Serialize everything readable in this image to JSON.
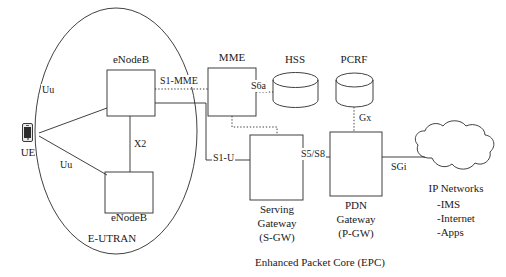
{
  "diagram": {
    "caption": "Enhanced Packet Core (EPC)",
    "domain_label": "E-UTRAN",
    "stroke_color": "#2b2b2b",
    "text_color": "#1a1a1a",
    "background": "#ffffff"
  },
  "nodes": {
    "ue": {
      "label": "UE",
      "icon": "mobile-phone-icon"
    },
    "enodeb_top": {
      "label": "eNodeB"
    },
    "enodeb_bottom": {
      "label": "eNodeB"
    },
    "mme": {
      "label": "MME"
    },
    "hss": {
      "label": "HSS",
      "shape": "cylinder"
    },
    "pcrf": {
      "label": "PCRF",
      "shape": "cylinder"
    },
    "sgw": {
      "label": "Serving\nGateway\n(S-GW)",
      "line1": "Serving",
      "line2": "Gateway",
      "line3": "(S-GW)"
    },
    "pgw": {
      "label": "PDN\nGateway\n(P-GW)",
      "line1": "PDN",
      "line2": "Gateway",
      "line3": "(P-GW)"
    },
    "ip_networks": {
      "label": "IP Networks",
      "shape": "cloud",
      "items": [
        "-IMS",
        "-Internet",
        "-Apps"
      ]
    }
  },
  "interfaces": {
    "uu_top": "Uu",
    "uu_bottom": "Uu",
    "x2": "X2",
    "s1_mme": "S1-MME",
    "s1_u": "S1-U",
    "s6a": "S6a",
    "s5_s8": "S5/S8",
    "gx": "Gx",
    "sgi": "SGi"
  }
}
